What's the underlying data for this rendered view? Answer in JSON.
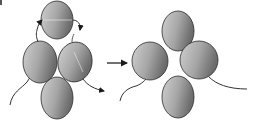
{
  "diagram": {
    "type": "transition",
    "description_label": "",
    "colors": {
      "ellipse_fill_light": "#c4c4c4",
      "ellipse_fill_dark": "#6e6e6e",
      "stroke": "#2a2a2a",
      "background": "#ffffff"
    },
    "before": {
      "ellipses": [
        {
          "id": "top",
          "cx": 57,
          "cy": 20,
          "rx": 16,
          "ry": 19
        },
        {
          "id": "left",
          "cx": 40,
          "cy": 62,
          "rx": 17,
          "ry": 21
        },
        {
          "id": "right",
          "cx": 75,
          "cy": 62,
          "rx": 17,
          "ry": 20
        },
        {
          "id": "bottom",
          "cx": 57,
          "cy": 98,
          "rx": 16,
          "ry": 21
        }
      ],
      "arrows": [
        "top-left-curved-arrow",
        "top-right-curved-arrow",
        "right-outgoing-arrow"
      ],
      "tails": [
        "left-tail"
      ]
    },
    "transition_arrow": {
      "x1": 107,
      "y1": 63,
      "x2": 128,
      "y2": 63
    },
    "after": {
      "ellipses": [
        {
          "id": "top",
          "cx": 178,
          "cy": 31,
          "rx": 16,
          "ry": 20
        },
        {
          "id": "left",
          "cx": 150,
          "cy": 61,
          "rx": 18,
          "ry": 19
        },
        {
          "id": "right",
          "cx": 199,
          "cy": 60,
          "rx": 19,
          "ry": 19
        },
        {
          "id": "bottom",
          "cx": 178,
          "cy": 97,
          "rx": 16,
          "ry": 21
        }
      ],
      "tails": [
        "left-tail",
        "right-tail"
      ]
    }
  }
}
